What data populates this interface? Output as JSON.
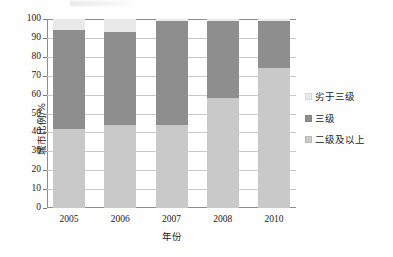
{
  "chart_data": {
    "type": "bar",
    "title": "",
    "subtitle": "",
    "xlabel": "年份",
    "ylabel": "城市比例/%",
    "categories": [
      "2005",
      "2006",
      "2007",
      "2008",
      "2010"
    ],
    "ylim": [
      0,
      100
    ],
    "yticks": [
      0,
      10,
      20,
      30,
      40,
      50,
      60,
      70,
      80,
      90,
      100
    ],
    "ytick_labels": [
      "0",
      "10",
      "20",
      "30",
      "40",
      "50",
      "60",
      "70",
      "80",
      "90",
      "100"
    ],
    "stacked": true,
    "grid": "horizontal",
    "legend_position": "right",
    "series": [
      {
        "name": "二级及以上",
        "color": "#c9c9c9",
        "values": [
          42,
          44,
          44,
          58,
          74
        ]
      },
      {
        "name": "三级",
        "color": "#8e8e8e",
        "values": [
          52,
          49,
          55,
          41,
          25
        ]
      },
      {
        "name": "劣于三级",
        "color": "#e9e9e9",
        "values": [
          6,
          7,
          1,
          1,
          1
        ]
      }
    ],
    "cumulative_tops": [
      {
        "category": "2005",
        "grade2_plus": 42,
        "grade3_top": 94,
        "total": 100
      },
      {
        "category": "2006",
        "grade2_plus": 44,
        "grade3_top": 93,
        "total": 100
      },
      {
        "category": "2007",
        "grade2_plus": 44,
        "grade3_top": 99,
        "total": 100
      },
      {
        "category": "2008",
        "grade2_plus": 58,
        "grade3_top": 99,
        "total": 100
      },
      {
        "category": "2010",
        "grade2_plus": 74,
        "grade3_top": 99,
        "total": 100
      }
    ]
  },
  "legend": {
    "items": [
      {
        "label": "劣于三级",
        "color": "#e9e9e9"
      },
      {
        "label": "三级",
        "color": "#8e8e8e"
      },
      {
        "label": "二级及以上",
        "color": "#c9c9c9"
      }
    ]
  }
}
